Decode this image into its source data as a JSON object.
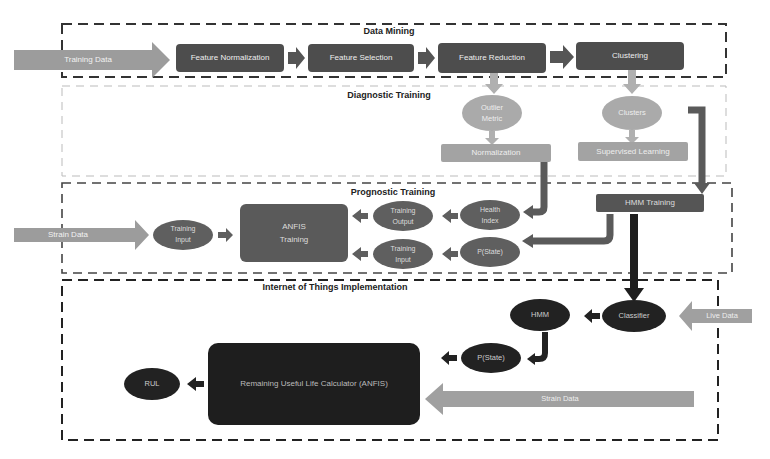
{
  "sections": {
    "data_mining": "Data Mining",
    "diagnostic": "Diagnostic Training",
    "prognostic": "Prognostic Training",
    "iot": "Internet of Things Implementation"
  },
  "data_mining": {
    "input_arrow": "Training Data",
    "steps": [
      "Feature Normalization",
      "Feature Selection",
      "Feature Reduction",
      "Clustering"
    ]
  },
  "diagnostic": {
    "outlier_metric": "Outlier Metric",
    "outlier_line1": "Outlier",
    "outlier_line2": "Metric",
    "normalization": "Normalization",
    "clusters": "Clusters",
    "supervised": "Supervised Learning"
  },
  "prognostic": {
    "input_arrow": "Strain Data",
    "training_input_left_1": "Training",
    "training_input_left_2": "Input",
    "anfis_1": "ANFIS",
    "anfis_2": "Training",
    "training_output_1": "Training",
    "training_output_2": "Output",
    "training_input_1": "Training",
    "training_input_2": "Input",
    "health_index_1": "Health",
    "health_index_2": "Index",
    "pstate": "P(State)",
    "hmm_training": "HMM Training"
  },
  "iot": {
    "live_data": "Live Data",
    "classifier": "Classifier",
    "hmm": "HMM",
    "pstate": "P(State)",
    "rul_calc": "Remaining Useful Life Calculator (ANFIS)",
    "rul": "RUL",
    "strain_data": "Strain Data"
  },
  "colors": {
    "dark_box": "#4a4a4a",
    "light_box": "#9a9a9a",
    "arrow_light": "#a8a8a8",
    "mid": "#5e5e5e",
    "black": "#1e1e1e"
  }
}
